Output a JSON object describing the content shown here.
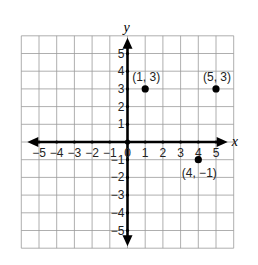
{
  "chart_data": {
    "type": "scatter",
    "title": "",
    "xlabel": "x",
    "ylabel": "y",
    "xlim": [
      -6,
      6
    ],
    "ylim": [
      -6,
      6
    ],
    "grid": true,
    "x_ticks": [
      -5,
      -4,
      -3,
      -2,
      -1,
      0,
      1,
      2,
      3,
      4,
      5
    ],
    "y_ticks": [
      -5,
      -4,
      -3,
      -2,
      -1,
      1,
      2,
      3,
      4,
      5
    ],
    "x_tick_labels": [
      "−5",
      "−4",
      "−3",
      "−2",
      "−1",
      "0",
      "1",
      "2",
      "3",
      "4",
      "5"
    ],
    "y_tick_labels": [
      "−5",
      "−4",
      "−3",
      "−2",
      "−1",
      "1",
      "2",
      "3",
      "4",
      "5"
    ],
    "points": [
      {
        "x": 1,
        "y": 3,
        "label": "(1, 3)",
        "label_pos": "above"
      },
      {
        "x": 5,
        "y": 3,
        "label": "(5, 3)",
        "label_pos": "above"
      },
      {
        "x": 4,
        "y": -1,
        "label": "(4, −1)",
        "label_pos": "below"
      }
    ]
  }
}
